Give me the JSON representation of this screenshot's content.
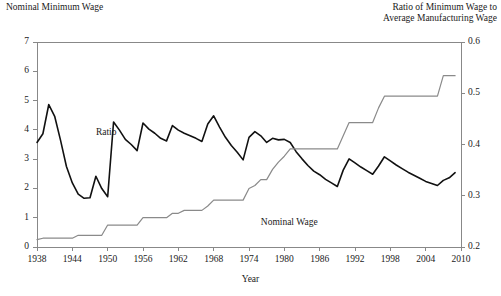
{
  "chart_data": {
    "type": "line",
    "title": "",
    "xlabel": "Year",
    "left_axis_title": "Nominal Minimum Wage",
    "right_axis_title_line1": "Ratio of Minimum Wage to",
    "right_axis_title_line2": "Average Manufacturing Wage",
    "grid": false,
    "legend_position": "inline-annotations",
    "x": [
      1938,
      1939,
      1940,
      1941,
      1942,
      1943,
      1944,
      1945,
      1946,
      1947,
      1948,
      1949,
      1950,
      1951,
      1952,
      1953,
      1954,
      1955,
      1956,
      1957,
      1958,
      1959,
      1960,
      1961,
      1962,
      1963,
      1964,
      1965,
      1966,
      1967,
      1968,
      1969,
      1970,
      1971,
      1972,
      1973,
      1974,
      1975,
      1976,
      1977,
      1978,
      1979,
      1980,
      1981,
      1982,
      1983,
      1984,
      1985,
      1986,
      1987,
      1988,
      1989,
      1990,
      1991,
      1992,
      1993,
      1994,
      1995,
      1996,
      1997,
      1998,
      1999,
      2000,
      2001,
      2002,
      2003,
      2004,
      2005,
      2006,
      2007,
      2008,
      2009
    ],
    "xlim": [
      1938,
      2010
    ],
    "xticks": [
      1938,
      1944,
      1950,
      1956,
      1962,
      1968,
      1974,
      1980,
      1986,
      1992,
      1998,
      2004,
      2010
    ],
    "xticklabels": [
      "1938",
      "1944",
      "1950",
      "1956",
      "1962",
      "1968",
      "1974",
      "1980",
      "1986",
      "1992",
      "1998",
      "2004",
      "2010"
    ],
    "left_ylim": [
      0,
      7
    ],
    "left_yticks": [
      0,
      1,
      2,
      3,
      4,
      5,
      6,
      7
    ],
    "left_yticklabels": [
      "0",
      "1",
      "2",
      "3",
      "4",
      "5",
      "6",
      "7"
    ],
    "right_ylim": [
      0.2,
      0.6
    ],
    "right_yticks": [
      0.2,
      0.3,
      0.4,
      0.5,
      0.6
    ],
    "right_yticklabels": [
      "0.2",
      "0.3",
      "0.4",
      "0.5",
      "0.6"
    ],
    "series": [
      {
        "name": "Ratio",
        "axis": "right",
        "label_text": "Ratio",
        "color": "#111111",
        "linewidth": 1.6,
        "values": [
          0.404,
          0.421,
          0.478,
          0.455,
          0.408,
          0.357,
          0.325,
          0.303,
          0.295,
          0.296,
          0.338,
          0.314,
          0.298,
          0.444,
          0.428,
          0.41,
          0.4,
          0.388,
          0.442,
          0.43,
          0.422,
          0.412,
          0.407,
          0.437,
          0.428,
          0.422,
          0.417,
          0.412,
          0.406,
          0.44,
          0.456,
          0.434,
          0.414,
          0.398,
          0.385,
          0.37,
          0.414,
          0.425,
          0.417,
          0.404,
          0.412,
          0.409,
          0.41,
          0.404,
          0.386,
          0.372,
          0.359,
          0.348,
          0.341,
          0.332,
          0.325,
          0.318,
          0.35,
          0.372,
          0.364,
          0.356,
          0.349,
          0.342,
          0.358,
          0.376,
          0.368,
          0.36,
          0.353,
          0.346,
          0.34,
          0.334,
          0.328,
          0.324,
          0.32,
          0.33,
          0.335,
          0.345
        ]
      },
      {
        "name": "Nominal Wage",
        "axis": "left",
        "label_text": "Nominal Wage",
        "color": "#8a8a8a",
        "linewidth": 1.2,
        "values": [
          0.25,
          0.3,
          0.3,
          0.3,
          0.3,
          0.3,
          0.3,
          0.4,
          0.4,
          0.4,
          0.4,
          0.4,
          0.75,
          0.75,
          0.75,
          0.75,
          0.75,
          0.75,
          1.0,
          1.0,
          1.0,
          1.0,
          1.0,
          1.15,
          1.15,
          1.25,
          1.25,
          1.25,
          1.25,
          1.4,
          1.6,
          1.6,
          1.6,
          1.6,
          1.6,
          1.6,
          2.0,
          2.1,
          2.3,
          2.3,
          2.65,
          2.9,
          3.1,
          3.35,
          3.35,
          3.35,
          3.35,
          3.35,
          3.35,
          3.35,
          3.35,
          3.35,
          3.8,
          4.25,
          4.25,
          4.25,
          4.25,
          4.25,
          4.75,
          5.15,
          5.15,
          5.15,
          5.15,
          5.15,
          5.15,
          5.15,
          5.15,
          5.15,
          5.15,
          5.85,
          5.85,
          5.85
        ]
      }
    ],
    "annotations": [
      {
        "text": "Ratio",
        "x": 1948,
        "y_px": 127
      },
      {
        "text": "Nominal Wage",
        "x": 1976,
        "y_px": 217
      }
    ]
  },
  "axes": {
    "plot_left_px": 37,
    "plot_right_px": 461,
    "plot_top_px": 42,
    "plot_bottom_px": 247
  },
  "colors": {
    "axis": "#888888",
    "text": "#1a1a1a",
    "ratio_line": "#111111",
    "wage_line": "#8a8a8a",
    "background": "#ffffff"
  }
}
